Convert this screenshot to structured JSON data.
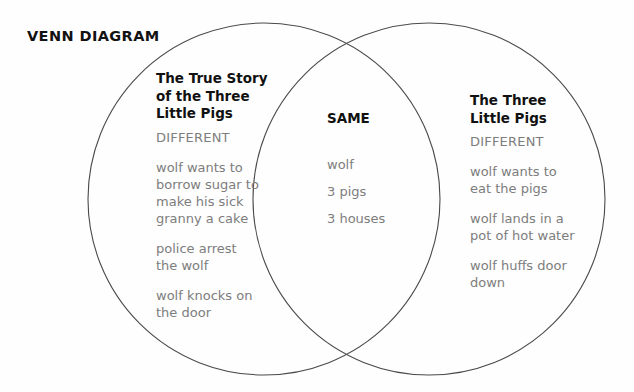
{
  "page": {
    "title": "VENN DIAGRAM",
    "background_color": "#fefefe",
    "stroke_color": "#4a4a4a",
    "heading_color": "#111111",
    "body_color": "#7d7d7d"
  },
  "diagram": {
    "type": "venn-2-set",
    "left_circle": {
      "heading": "The True Story\nof the Three\nLittle Pigs",
      "subheading": "DIFFERENT",
      "items": [
        "wolf wants to\nborrow sugar to\nmake his sick\ngranny a cake",
        "police arrest\nthe wolf",
        "wolf knocks on\nthe door"
      ]
    },
    "overlap": {
      "heading": "SAME",
      "items": [
        "wolf",
        "3 pigs",
        "3 houses"
      ]
    },
    "right_circle": {
      "heading": "The Three\nLittle Pigs",
      "subheading": "DIFFERENT",
      "items": [
        "wolf wants to\neat the pigs",
        "wolf lands in a\npot of hot water",
        "wolf huffs door\ndown"
      ]
    }
  }
}
